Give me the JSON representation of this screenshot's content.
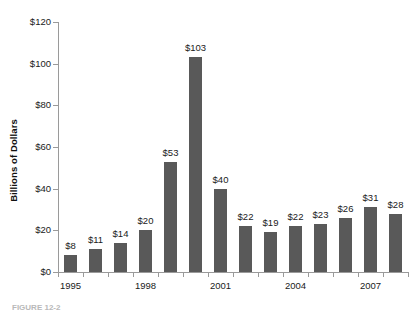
{
  "chart_data": {
    "type": "bar",
    "title": "",
    "xlabel": "",
    "ylabel": "Billions of Dollars",
    "categories": [
      "1995",
      "1996",
      "1997",
      "1998",
      "1999",
      "2000",
      "2001",
      "2002",
      "2003",
      "2004",
      "2005",
      "2006",
      "2007",
      "2008"
    ],
    "values": [
      8,
      11,
      14,
      20,
      53,
      103,
      40,
      22,
      19,
      22,
      23,
      26,
      31,
      28
    ],
    "value_labels": [
      "$8",
      "$11",
      "$14",
      "$20",
      "$53",
      "$103",
      "$40",
      "$22",
      "$19",
      "$22",
      "$23",
      "$26",
      "$31",
      "$28"
    ],
    "x_tick_labels": [
      "1995",
      "1998",
      "2001",
      "2004",
      "2007"
    ],
    "x_tick_indices": [
      0,
      3,
      6,
      9,
      12
    ],
    "y_ticks": [
      0,
      20,
      40,
      60,
      80,
      100,
      120
    ],
    "y_tick_labels": [
      "$0",
      "$20",
      "$40",
      "$60",
      "$80",
      "$100",
      "$120"
    ],
    "ylim": [
      0,
      120
    ],
    "grid": false,
    "legend": false,
    "legend_position": "none",
    "bar_color": "#595959",
    "axis_color": "#9a9a9a",
    "background_color": "#ffffff",
    "text_color": "#1a1a1a"
  },
  "caption": {
    "text": "FIGURE 12-2"
  }
}
